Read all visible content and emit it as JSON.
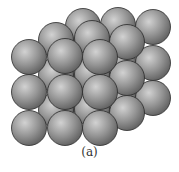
{
  "figure": {
    "caption": "(a)",
    "sphere_radius": 17.5,
    "colors": {
      "sphere_light": "#c8c8c8",
      "sphere_mid": "#8e8e8e",
      "sphere_dark": "#5a5a5a",
      "outline": "#2a2a2a"
    },
    "layers": [
      {
        "name": "back",
        "spheres": [
          [
            83,
            26
          ],
          [
            118,
            25
          ],
          [
            153,
            27
          ],
          [
            83,
            62
          ],
          [
            118,
            61
          ],
          [
            153,
            63
          ],
          [
            83,
            97
          ],
          [
            118,
            96
          ],
          [
            153,
            98
          ]
        ]
      },
      {
        "name": "middle",
        "spheres": [
          [
            56,
            40
          ],
          [
            92,
            38
          ],
          [
            127,
            42
          ],
          [
            56,
            75
          ],
          [
            92,
            74
          ],
          [
            127,
            78
          ],
          [
            56,
            110
          ],
          [
            92,
            109
          ],
          [
            127,
            113
          ]
        ]
      },
      {
        "name": "front",
        "spheres": [
          [
            29,
            57
          ],
          [
            65,
            56
          ],
          [
            100,
            57
          ],
          [
            29,
            92
          ],
          [
            65,
            92
          ],
          [
            100,
            92
          ],
          [
            29,
            128
          ],
          [
            65,
            128
          ],
          [
            100,
            128
          ]
        ]
      }
    ]
  }
}
